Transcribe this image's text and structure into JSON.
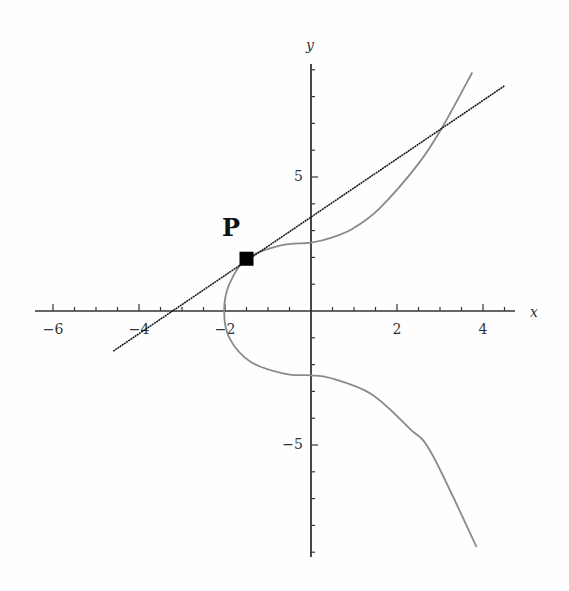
{
  "chart_data": {
    "type": "line",
    "title": "",
    "xlabel": "x",
    "ylabel": "y",
    "xlim": [
      -6.5,
      4.8
    ],
    "ylim": [
      -9,
      9
    ],
    "grid": false,
    "x_ticks": [
      -6,
      -4,
      -2,
      2,
      4
    ],
    "x_tick_labels": [
      "−6",
      "−4",
      "−2",
      "2",
      "4"
    ],
    "y_ticks": [
      -5,
      5
    ],
    "y_tick_labels": [
      "−5",
      "5"
    ],
    "series": [
      {
        "name": "elliptic curve",
        "color": "#8a8a8a",
        "points": [
          [
            3.75,
            8.9
          ],
          [
            3.07,
            6.9
          ],
          [
            2.5,
            5.5
          ],
          [
            1.6,
            3.84
          ],
          [
            1.0,
            3.1
          ],
          [
            0.5,
            2.75
          ],
          [
            0.0,
            2.55
          ],
          [
            -0.7,
            2.45
          ],
          [
            -1.5,
            1.95
          ],
          [
            -1.9,
            1.0
          ],
          [
            -2.02,
            0.0
          ],
          [
            -1.9,
            -1.0
          ],
          [
            -1.4,
            -1.9
          ],
          [
            -0.6,
            -2.35
          ],
          [
            0.0,
            -2.4
          ],
          [
            0.45,
            -2.5
          ],
          [
            1.4,
            -3.1
          ],
          [
            2.3,
            -4.4
          ],
          [
            2.8,
            -5.3
          ],
          [
            3.85,
            -8.8
          ]
        ]
      },
      {
        "name": "line through P",
        "color": "#111111",
        "points": [
          [
            -4.6,
            -1.5
          ],
          [
            4.5,
            8.4
          ]
        ]
      }
    ],
    "annotations": [
      {
        "label": "P",
        "x": -1.5,
        "y": 1.95,
        "marker": "square"
      }
    ]
  },
  "labels": {
    "x_axis": "x",
    "y_axis": "y",
    "point": "P",
    "x_ticks": [
      "−6",
      "−4",
      "−2",
      "2",
      "4"
    ],
    "y_ticks": [
      "5",
      "−5"
    ]
  }
}
